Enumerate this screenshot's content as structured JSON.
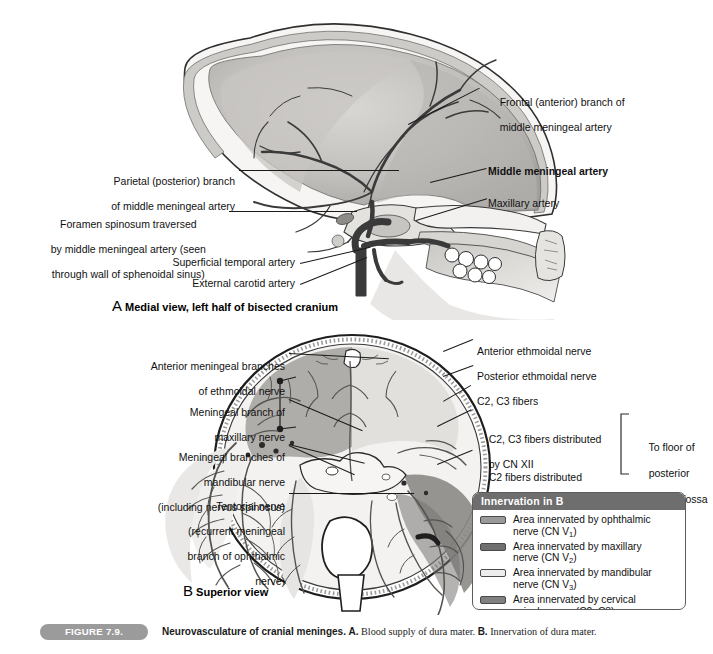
{
  "figure": {
    "pill": "FIGURE 7.9.",
    "title": "Neurovasculature of cranial meninges.",
    "part_a_marker": "A.",
    "part_a_text": "Blood supply of dura mater.",
    "part_b_marker": "B.",
    "part_b_text": "Innervation of dura mater."
  },
  "panel_a": {
    "view_marker": "A",
    "view_caption": "Medial view, left half of bisected cranium",
    "labels": {
      "parietal_bold": "Parietal (posterior) branch",
      "parietal_rest": "of middle meningeal artery",
      "foramen_l1": "Foramen spinosum traversed",
      "foramen_l2": "by middle meningeal artery (seen",
      "foramen_l3": "through wall of sphenoidal sinus)",
      "superficial_temporal": "Superficial temporal artery",
      "external_carotid": "External carotid artery",
      "frontal_bold": "Frontal (anterior) branch",
      "frontal_of": " of",
      "frontal_rest": "middle meningeal artery",
      "middle_meningeal": "Middle meningeal artery",
      "maxillary": "Maxillary artery"
    }
  },
  "panel_b": {
    "view_marker": "B",
    "view_caption": "Superior view",
    "labels": {
      "ant_meningeal_l1": "Anterior meningeal branches",
      "ant_meningeal_l2": "of ethmoidal nerve",
      "maxillary_l1": "Meningeal branch of",
      "maxillary_l2": "maxillary nerve",
      "mandibular_l1": "Meningeal branches of",
      "mandibular_l2": "mandibular nerve",
      "mandibular_l3": "(including nervus spinosus)",
      "tentorial_l1": "Tentorial nerve",
      "tentorial_l2": "(recurrent meningeal",
      "tentorial_l3": "branch of ophthalmic",
      "tentorial_l4": "nerve)",
      "ant_ethmoidal": "Anterior ethmoidal nerve",
      "post_ethmoidal": "Posterior ethmoidal nerve",
      "c2c3_fibers": "C2, C3 fibers",
      "c2c3_cn12_l1": "C2, C3 fibers distributed",
      "c2c3_cn12_l2": "by CN XII",
      "c2_cn10_l1": "C2 fibers distributed",
      "c2_cn10_l2": "by CN X",
      "bracket_l1": "To floor of",
      "bracket_l2": "posterior",
      "bracket_l3": "cranial fossa"
    }
  },
  "legend": {
    "header": "Innervation in B",
    "items": [
      {
        "swatch": "#9a9a9a",
        "line1": "Area innervated by ophthalmic",
        "line2_pre": "nerve (CN V",
        "line2_sub": "1",
        "line2_post": ")"
      },
      {
        "swatch": "#6f6f6f",
        "line1": "Area innervated by maxillary",
        "line2_pre": "nerve (CN V",
        "line2_sub": "2",
        "line2_post": ")"
      },
      {
        "swatch": "#ededed",
        "line1": "Area innervated by mandibular",
        "line2_pre": "nerve (CN V",
        "line2_sub": "3",
        "line2_post": ")"
      },
      {
        "swatch": "#808080",
        "line1": "Area innervated by cervical",
        "line2_pre": "spinal nerves (C2, C3)",
        "line2_sub": "",
        "line2_post": ""
      }
    ]
  },
  "colors": {
    "bone": "#e8e5e0",
    "dura_mid": "#b9b7b4",
    "dura_dark": "#8f8d8b",
    "vessel": "#4a4a4a",
    "legend_header_bg": "#6e6e6e",
    "pill_bg": "#9b9b9b"
  }
}
